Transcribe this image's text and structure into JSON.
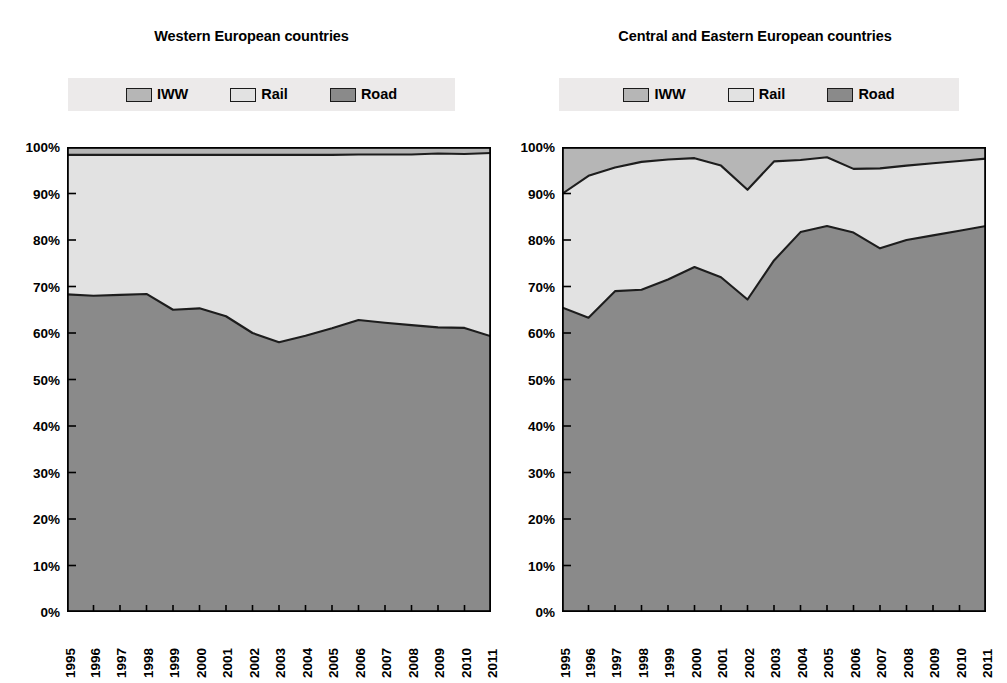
{
  "figure": {
    "panels": [
      {
        "id": "western",
        "title": "Western European countries",
        "legend": [
          {
            "label": "IWW",
            "color": "#b6b6b6",
            "name": "iww"
          },
          {
            "label": "Rail",
            "color": "#e2e2e2",
            "name": "rail"
          },
          {
            "label": "Road",
            "color": "#8a8a8a",
            "name": "road"
          }
        ]
      },
      {
        "id": "cee",
        "title": "Central and Eastern European countries",
        "legend": [
          {
            "label": "IWW",
            "color": "#b6b6b6",
            "name": "iww"
          },
          {
            "label": "Rail",
            "color": "#e2e2e2",
            "name": "rail"
          },
          {
            "label": "Road",
            "color": "#8a8a8a",
            "name": "road"
          }
        ]
      }
    ]
  },
  "axis": {
    "y_ticks": [
      "0%",
      "10%",
      "20%",
      "30%",
      "40%",
      "50%",
      "60%",
      "70%",
      "80%",
      "90%",
      "100%"
    ],
    "x_ticks": [
      "1995",
      "1996",
      "1997",
      "1998",
      "1999",
      "2000",
      "2001",
      "2002",
      "2003",
      "2004",
      "2005",
      "2006",
      "2007",
      "2008",
      "2009",
      "2010",
      "2011"
    ]
  },
  "chart_data": [
    {
      "type": "area",
      "stacked": true,
      "normalized": true,
      "title": "Western European countries",
      "xlabel": "",
      "ylabel": "",
      "ylim": [
        0,
        100
      ],
      "grid": false,
      "legend_position": "top",
      "categories": [
        "1995",
        "1996",
        "1997",
        "1998",
        "1999",
        "2000",
        "2001",
        "2002",
        "2003",
        "2004",
        "2005",
        "2006",
        "2007",
        "2008",
        "2009",
        "2010",
        "2011"
      ],
      "series": [
        {
          "name": "Road",
          "color": "#8a8a8a",
          "values": [
            68.3,
            68.0,
            68.2,
            68.4,
            65.0,
            65.3,
            63.6,
            60.0,
            58.0,
            59.4,
            61.0,
            62.8,
            62.2,
            61.7,
            61.2,
            61.1,
            59.3
          ]
        },
        {
          "name": "Rail",
          "color": "#e2e2e2",
          "values": [
            30.0,
            30.3,
            30.1,
            29.9,
            33.3,
            33.0,
            34.7,
            38.3,
            40.3,
            38.9,
            37.3,
            35.6,
            36.2,
            36.7,
            37.4,
            37.4,
            39.4
          ]
        },
        {
          "name": "IWW",
          "color": "#b6b6b6",
          "values": [
            1.7,
            1.7,
            1.7,
            1.7,
            1.7,
            1.7,
            1.7,
            1.7,
            1.7,
            1.7,
            1.7,
            1.6,
            1.6,
            1.6,
            1.4,
            1.5,
            1.3
          ]
        }
      ],
      "cumulative_road": [
        68.3,
        68.0,
        68.2,
        68.4,
        65.0,
        65.3,
        63.6,
        60.0,
        58.0,
        59.4,
        61.0,
        62.8,
        62.2,
        61.7,
        61.2,
        61.1,
        59.3
      ],
      "cumulative_road_rail": [
        98.3,
        98.3,
        98.3,
        98.3,
        98.3,
        98.3,
        98.3,
        98.3,
        98.3,
        98.3,
        98.3,
        98.4,
        98.4,
        98.4,
        98.6,
        98.5,
        98.7
      ]
    },
    {
      "type": "area",
      "stacked": true,
      "normalized": true,
      "title": "Central and Eastern European countries",
      "xlabel": "",
      "ylabel": "",
      "ylim": [
        0,
        100
      ],
      "grid": false,
      "legend_position": "top",
      "categories": [
        "1995",
        "1996",
        "1997",
        "1998",
        "1999",
        "2000",
        "2001",
        "2002",
        "2003",
        "2004",
        "2005",
        "2006",
        "2007",
        "2008",
        "2009",
        "2010",
        "2011"
      ],
      "series": [
        {
          "name": "Road",
          "color": "#8a8a8a",
          "values": [
            65.5,
            63.3,
            69.0,
            69.3,
            71.5,
            74.2,
            72.0,
            67.2,
            75.6,
            81.7,
            83.0,
            81.6,
            78.2,
            80.0,
            81.0,
            82.0,
            83.0
          ]
        },
        {
          "name": "Rail",
          "color": "#e2e2e2",
          "values": [
            24.4,
            30.5,
            26.6,
            27.5,
            25.8,
            23.4,
            24.0,
            23.6,
            21.3,
            15.5,
            14.8,
            13.7,
            17.2,
            16.0,
            15.5,
            15.0,
            14.5
          ]
        },
        {
          "name": "IWW",
          "color": "#b6b6b6",
          "values": [
            10.1,
            6.2,
            4.4,
            3.2,
            2.7,
            2.4,
            4.0,
            9.2,
            3.1,
            2.8,
            2.2,
            4.7,
            4.6,
            4.0,
            3.5,
            3.0,
            2.5
          ]
        }
      ],
      "cumulative_road": [
        65.5,
        63.3,
        69.0,
        69.3,
        71.5,
        74.2,
        72.0,
        67.2,
        75.6,
        81.7,
        83.0,
        81.6,
        78.2,
        80.0,
        81.0,
        82.0,
        83.0
      ],
      "cumulative_road_rail": [
        89.9,
        93.8,
        95.6,
        96.8,
        97.3,
        97.6,
        96.0,
        90.8,
        96.9,
        97.2,
        97.8,
        95.3,
        95.4,
        96.0,
        96.5,
        97.0,
        97.5
      ]
    }
  ]
}
